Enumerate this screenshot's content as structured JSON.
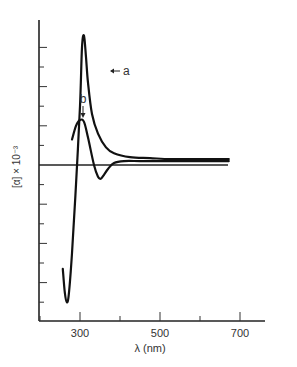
{
  "chart_data": {
    "type": "line",
    "title": "",
    "xlabel": "λ (nm)",
    "ylabel": "[α] × 10⁻³",
    "xlim": [
      200,
      730
    ],
    "ylim": [
      -8,
      7.3
    ],
    "x_ticks": [
      200,
      300,
      400,
      500,
      600,
      700
    ],
    "x_tick_labels": [
      "300",
      "500",
      "700"
    ],
    "y_ticks": [
      -7,
      -6,
      -5,
      -4,
      -3,
      -2,
      -1,
      0,
      1,
      2,
      3,
      4,
      5,
      6
    ],
    "y_tick_labels": [],
    "grid": false,
    "zero_line": true,
    "series": [
      {
        "name": "a",
        "x": [
          257,
          262,
          267,
          272,
          280,
          290,
          300,
          305,
          310,
          315,
          320,
          330,
          345,
          365,
          385,
          425,
          475,
          525,
          575,
          625,
          672
        ],
        "y": [
          -5.3,
          -6.5,
          -7.0,
          -6.6,
          -4.5,
          -1.0,
          3.0,
          6.0,
          6.6,
          5.5,
          4.2,
          2.6,
          1.6,
          0.9,
          0.6,
          0.4,
          0.35,
          0.3,
          0.3,
          0.3,
          0.3
        ]
      },
      {
        "name": "b",
        "x": [
          280,
          290,
          300,
          310,
          320,
          335,
          345,
          352,
          360,
          370,
          385,
          410,
          450,
          500,
          550,
          600,
          672
        ],
        "y": [
          1.3,
          2.0,
          2.3,
          2.2,
          1.4,
          0.0,
          -0.6,
          -0.7,
          -0.5,
          -0.2,
          0.1,
          0.2,
          0.2,
          0.2,
          0.2,
          0.2,
          0.2
        ]
      }
    ],
    "annotations": [
      {
        "label": "a",
        "points_to": {
          "x": 312,
          "y": 4.7
        },
        "arrow": "left"
      },
      {
        "label": "b",
        "points_to": {
          "x": 310,
          "y": 2.4
        },
        "arrow": "down"
      }
    ]
  }
}
